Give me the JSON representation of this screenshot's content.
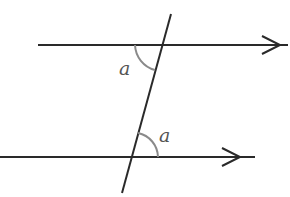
{
  "diagram": {
    "type": "parallel-lines-transversal",
    "angle_labels": {
      "top": "a",
      "bottom": "a"
    },
    "colors": {
      "line": "#2a2a2a",
      "arc": "#8a8a8a",
      "label": "#555555",
      "background": "#ffffff"
    }
  }
}
